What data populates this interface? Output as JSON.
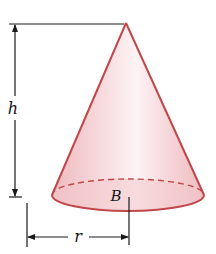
{
  "figure": {
    "labels": {
      "height": "h",
      "radius": "r",
      "base": "B"
    }
  },
  "colors": {
    "cone_edge": "#c0474a",
    "cone_fill_light": "#fdf1f2",
    "cone_fill_mid": "#f5cfd2",
    "cone_fill_dark": "#eeb9bd",
    "base_fill": "#f2c9cc",
    "dimension_line": "#1a1a1a",
    "background": "#ffffff"
  },
  "geometry": {
    "apex": [
      126,
      23
    ],
    "base_center": [
      128,
      195
    ],
    "base_rx": 76,
    "base_ry": 16,
    "height_line_x": 15,
    "radius_line_y": 237
  }
}
